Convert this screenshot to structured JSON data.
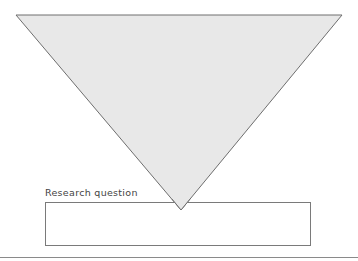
{
  "diagram": {
    "type": "funnel",
    "shape": "inverted-triangle",
    "fill_color": "#e8e8e8",
    "stroke_color": "#6e6e6e"
  },
  "research_question": {
    "label": "Research question",
    "box_value": ""
  },
  "colors": {
    "background": "#ffffff",
    "box_border": "#7a7a7a",
    "rule": "#8a8a8a",
    "label_text": "#444444"
  }
}
